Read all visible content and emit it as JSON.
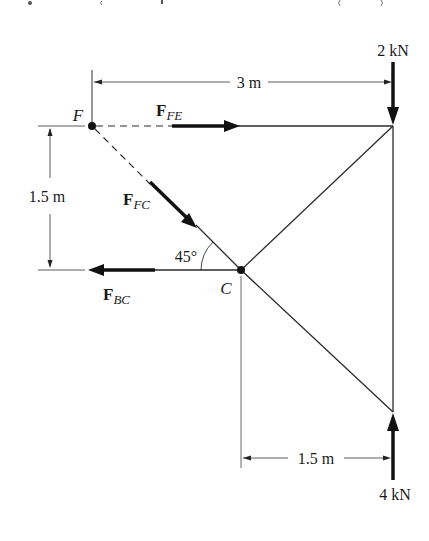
{
  "diagram": {
    "type": "truss free-body diagram",
    "cropped_top_text": "Q . . . g . . ,   . . . . . . . . . . . .  ( . . . )  . .",
    "points": {
      "F": {
        "label": "F",
        "x": 92,
        "y": 126
      },
      "C": {
        "label": "C",
        "x": 241,
        "y": 270
      },
      "top_right": {
        "x": 393,
        "y": 126
      },
      "bottom_right": {
        "x": 393,
        "y": 412
      }
    },
    "forces": {
      "FE": {
        "label_main": "F",
        "label_sub": "FE",
        "direction": "right"
      },
      "FC": {
        "label_main": "F",
        "label_sub": "FC",
        "direction": "down-right"
      },
      "BC": {
        "label_main": "F",
        "label_sub": "BC",
        "direction": "left"
      },
      "load_top": {
        "label": "2 kN",
        "direction": "down"
      },
      "load_bottom": {
        "label": "4 kN",
        "direction": "up"
      }
    },
    "dimensions": {
      "top_width": "3 m",
      "left_height": "1.5 m",
      "bottom_width": "1.5 m"
    },
    "angle": {
      "label": "45°"
    }
  }
}
